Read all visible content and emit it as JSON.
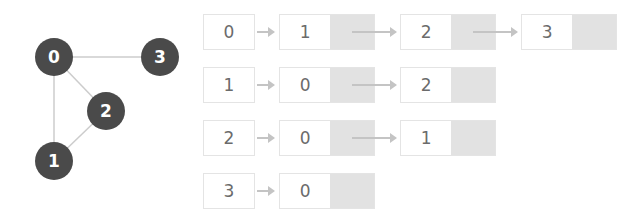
{
  "graph": {
    "nodes": [
      {
        "id": "0",
        "label": "0",
        "x": 54,
        "y": 57
      },
      {
        "id": "1",
        "label": "1",
        "x": 54,
        "y": 161
      },
      {
        "id": "2",
        "label": "2",
        "x": 106,
        "y": 111
      },
      {
        "id": "3",
        "label": "3",
        "x": 160,
        "y": 57
      }
    ],
    "edges": [
      [
        "0",
        "3"
      ],
      [
        "0",
        "1"
      ],
      [
        "0",
        "2"
      ],
      [
        "2",
        "1"
      ]
    ],
    "node_color": "#4a4a4a",
    "edge_color": "#cccccc",
    "label_color": "#ffffff"
  },
  "adjacency_list": {
    "rows": [
      {
        "head": "0",
        "neighbors": [
          "1",
          "2",
          "3"
        ]
      },
      {
        "head": "1",
        "neighbors": [
          "0",
          "2"
        ]
      },
      {
        "head": "2",
        "neighbors": [
          "0",
          "1"
        ]
      },
      {
        "head": "3",
        "neighbors": [
          "0"
        ]
      }
    ]
  }
}
